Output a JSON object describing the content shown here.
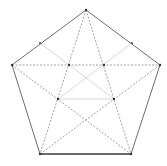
{
  "diagram": {
    "colors": {
      "background": "#ffffff",
      "solid_edge": "#6e6e6e",
      "bottom_edge": "#3a3a3a",
      "dashed": "#8a8a8a",
      "light": "#d8d8d8",
      "vertex": "#333333"
    },
    "vertices": {
      "top": [
        86,
        10
      ],
      "left": [
        12,
        65
      ],
      "right": [
        160,
        65
      ],
      "bottom_left": [
        40,
        154
      ],
      "bottom_right": [
        131,
        154
      ]
    },
    "inner_points": {
      "upper_left": [
        69,
        65
      ],
      "upper_right": [
        104,
        65
      ],
      "lower_left": [
        58,
        99
      ],
      "lower_right": [
        114,
        99
      ],
      "center": [
        86,
        119
      ]
    },
    "edge_midpoints": {
      "upper_left": [
        40,
        43
      ],
      "upper_right": [
        132,
        43
      ]
    }
  }
}
